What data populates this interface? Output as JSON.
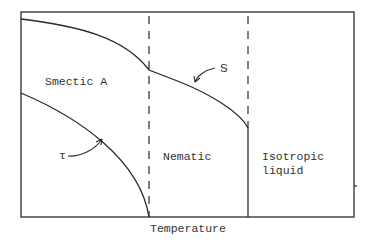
{
  "diagram": {
    "type": "phase-diagram",
    "xlabel": "Temperature",
    "regions": [
      {
        "id": "smectic-a",
        "label": "Smectic A"
      },
      {
        "id": "nematic",
        "label": "Nematic"
      },
      {
        "id": "isotropic",
        "label_line1": "Isotropic",
        "label_line2": "liquid"
      }
    ],
    "curves": [
      {
        "id": "order-parameter-s",
        "label": "S"
      },
      {
        "id": "order-parameter-tau",
        "label": "τ"
      }
    ],
    "colors": {
      "line": "#2a2a2a",
      "text": "#333333",
      "background": "#ffffff"
    }
  }
}
